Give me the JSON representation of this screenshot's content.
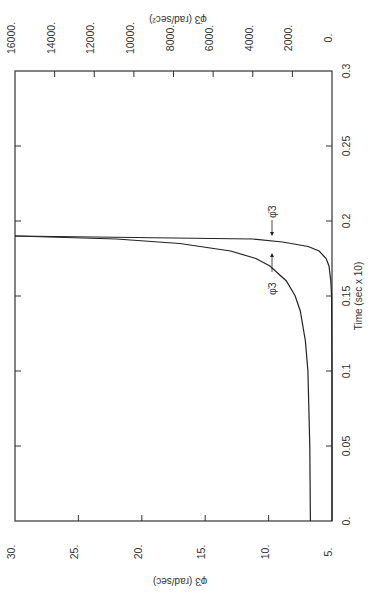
{
  "chart_data": [
    {
      "type": "line",
      "orientation": "rotated 90deg counter-clockwise (time axis vertical on right, value axes horizontal)",
      "xlabel": "Time (sec x 10)",
      "x_ticks": [
        "0.",
        "0.05",
        "0.1",
        "0.15",
        "0.2",
        "0.25",
        "0.3"
      ],
      "xlim": [
        0,
        0.3
      ],
      "bottom_axis": {
        "label": "φ̇3 (rad/sec)",
        "ticks": [
          "30.",
          "25.",
          "20.",
          "15.",
          "10.",
          "5."
        ],
        "range": [
          5,
          30
        ]
      },
      "top_axis": {
        "label": "φ̈3 (rad/sec²)",
        "ticks": [
          "16000.",
          "14000.",
          "12000.",
          "10000.",
          "8000.",
          "6000.",
          "4000.",
          "2000.",
          "0."
        ],
        "range": [
          0,
          16000
        ]
      },
      "series": [
        {
          "name": "φ̇3",
          "axis": "bottom",
          "x": [
            0.0,
            0.05,
            0.1,
            0.12,
            0.14,
            0.15,
            0.16,
            0.17,
            0.175,
            0.18,
            0.185,
            0.188,
            0.19
          ],
          "values": [
            6.7,
            6.75,
            6.9,
            7.1,
            7.5,
            7.9,
            8.6,
            9.9,
            11.0,
            13.0,
            17.0,
            22.0,
            30.0
          ]
        },
        {
          "name": "φ̈3",
          "axis": "top",
          "x": [
            0.0,
            0.1,
            0.15,
            0.16,
            0.17,
            0.175,
            0.18,
            0.183,
            0.186,
            0.188,
            0.19
          ],
          "values": [
            0,
            0,
            20,
            60,
            150,
            300,
            650,
            1200,
            2500,
            4000,
            16000
          ]
        }
      ],
      "annotations": [
        "φ̈3 (arrow to acceleration curve)",
        "φ̇3 (arrow to velocity curve)"
      ],
      "grid": false
    }
  ],
  "labels": {
    "top_axis_title": "φ̈3 (rad/sec²)",
    "bottom_axis_title": "φ̇3 (rad/sec)",
    "time_axis_title": "Time (sec x 10)",
    "annot_acc": "φ̈3",
    "annot_vel": "φ̇3"
  }
}
